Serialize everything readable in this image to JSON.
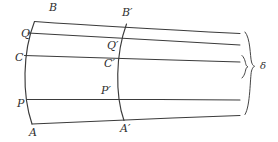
{
  "figure": {
    "type": "geometric-diagram",
    "width": 278,
    "height": 142,
    "background_color": "#ffffff",
    "stroke_color": "#3b3b3b"
  },
  "labels": {
    "left_section": [
      {
        "id": "B",
        "text": "B",
        "x": 49,
        "y": 2
      },
      {
        "id": "Q",
        "text": "Q",
        "x": 21,
        "y": 28
      },
      {
        "id": "C",
        "text": "C",
        "x": 15,
        "y": 52
      },
      {
        "id": "P",
        "text": "P",
        "x": 17,
        "y": 98
      },
      {
        "id": "A",
        "text": "A",
        "x": 29,
        "y": 127
      }
    ],
    "middle_section": [
      {
        "id": "Bp",
        "text": "B′",
        "x": 122,
        "y": 7
      },
      {
        "id": "Qp",
        "text": "Q′",
        "x": 107,
        "y": 40
      },
      {
        "id": "Cp",
        "text": "C′",
        "x": 104,
        "y": 58
      },
      {
        "id": "Pp",
        "text": "P′",
        "x": 101,
        "y": 85
      },
      {
        "id": "Ap",
        "text": "A′",
        "x": 120,
        "y": 123
      }
    ],
    "dimension": [
      {
        "id": "delta",
        "text": "δ",
        "x": 260,
        "y": 66
      }
    ]
  },
  "geometry": {
    "fibers": [
      {
        "id": "fiber-B",
        "name": "top-fiber-B-to-right",
        "path": "M 34.5,21.5 C 90,25.5 170,30.0 240,33.5"
      },
      {
        "id": "fiber-Q",
        "name": "fiber-Q-to-right",
        "path": "M 28.0,33.0 C 88,36.0 170,41.0 240,45.0"
      },
      {
        "id": "fiber-C",
        "name": "neutral-fiber-C-to-right",
        "path": "M 24.5,55.5 C 86,57.5 170,60.0 240,62.0"
      },
      {
        "id": "fiber-P",
        "name": "fiber-P-to-right",
        "path": "M 26.5,99.5 C 88,99.0 170,99.5 240,100.0"
      },
      {
        "id": "fiber-A",
        "name": "bottom-fiber-A-to-right",
        "path": "M 32.0,124.0 C 90,121.0 170,118.0 240,115.5"
      }
    ],
    "sections": [
      {
        "id": "section-left",
        "name": "left-cross-section-A-B",
        "path": "M 34.5,21.5 C 22.5,52 22.0,95 32.0,124.0"
      },
      {
        "id": "section-middle",
        "name": "middle-cross-section-Ap-Bp",
        "path": "M 126.5,24.0 C 115.5,54 115.0,95 124.0,120.5"
      }
    ],
    "braces": [
      {
        "id": "brace-outer",
        "name": "outer-brace-full-depth",
        "path": "M 245.0,32.0 C 250.5,38 250.0,56 251.5,62 C 252.6,65.5 253.6,66.0 254.6,66.3 C 253.6,66.8 252.6,67.4 251.5,71 C 250.0,77 250.5,106 245.0,114.5"
      },
      {
        "id": "brace-delta",
        "name": "delta-interval-brace",
        "path": "M 242.0,55.5 C 245.6,59.0 245.2,63.5 246.3,65.4 C 246.9,66.4 247.4,66.5 248.0,66.6 C 247.4,66.9 246.9,67.2 246.3,68.2 C 245.2,70.1 245.6,74.5 242.0,78.0"
      }
    ]
  }
}
